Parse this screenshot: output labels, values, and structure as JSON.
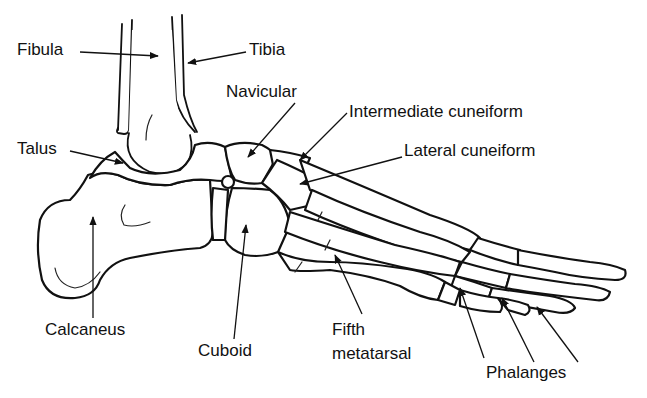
{
  "labels": {
    "fibula": "Fibula",
    "tibia": "Tibia",
    "navicular": "Navicular",
    "intermediate_cuneiform": "Intermediate cuneiform",
    "lateral_cuneiform": "Lateral cuneiform",
    "talus": "Talus",
    "calcaneus": "Calcaneus",
    "cuboid": "Cuboid",
    "fifth_metatarsal_line1": "Fifth",
    "fifth_metatarsal_line2": "metatarsal",
    "phalanges": "Phalanges"
  },
  "colors": {
    "ink": "#111111",
    "background": "#ffffff"
  }
}
